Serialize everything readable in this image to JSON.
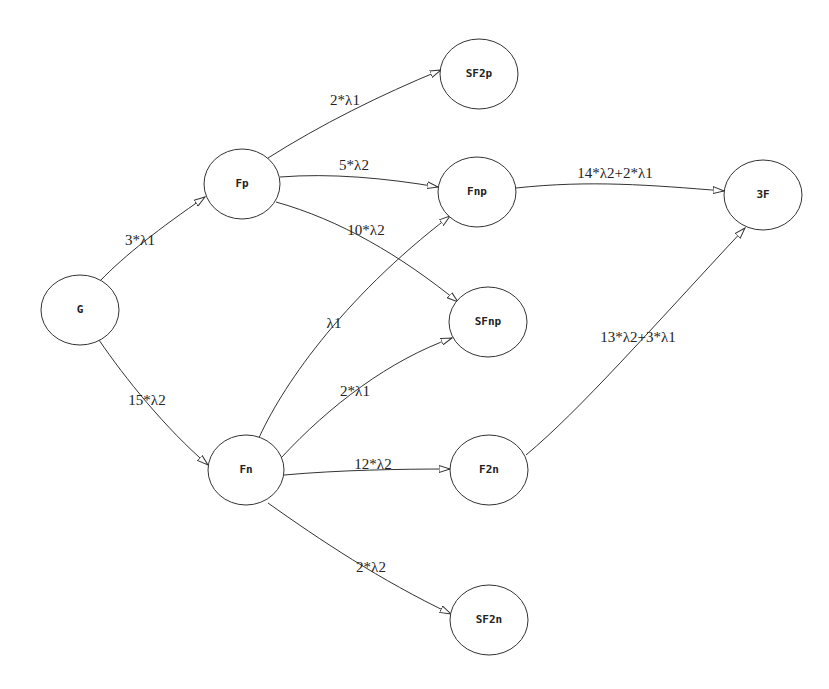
{
  "diagram": {
    "type": "state-transition-graph",
    "nodes": [
      {
        "id": "G",
        "label": "G",
        "cx": 80,
        "cy": 310,
        "rx": 39,
        "ry": 35
      },
      {
        "id": "Fp",
        "label": "Fp",
        "cx": 242,
        "cy": 184,
        "rx": 38,
        "ry": 35
      },
      {
        "id": "Fn",
        "label": "Fn",
        "cx": 246,
        "cy": 470,
        "rx": 38,
        "ry": 35
      },
      {
        "id": "SF2p",
        "label": "SF2p",
        "cx": 479,
        "cy": 74,
        "rx": 39,
        "ry": 35
      },
      {
        "id": "Fnp",
        "label": "Fnp",
        "cx": 477,
        "cy": 192,
        "rx": 39,
        "ry": 35
      },
      {
        "id": "SFnp",
        "label": "SFnp",
        "cx": 488,
        "cy": 322,
        "rx": 39,
        "ry": 35
      },
      {
        "id": "F2n",
        "label": "F2n",
        "cx": 489,
        "cy": 470,
        "rx": 39,
        "ry": 35
      },
      {
        "id": "SF2n",
        "label": "SF2n",
        "cx": 489,
        "cy": 620,
        "rx": 39,
        "ry": 35
      },
      {
        "id": "3F",
        "label": "3F",
        "cx": 763,
        "cy": 195,
        "rx": 39,
        "ry": 35
      }
    ],
    "edges": [
      {
        "from": "G",
        "to": "Fp",
        "label": "3*λ1",
        "path": "M100,281 C125,255 160,228 205,197",
        "lx": 140,
        "ly": 245
      },
      {
        "from": "G",
        "to": "Fn",
        "label": "15*λ2",
        "path": "M99,340 C125,378 165,428 208,465",
        "lx": 147,
        "ly": 405
      },
      {
        "from": "Fp",
        "to": "SF2p",
        "label": "2*λ1",
        "path": "M268,158 C320,125 380,95 441,70",
        "lx": 345,
        "ly": 105
      },
      {
        "from": "Fp",
        "to": "Fnp",
        "label": "5*λ2",
        "path": "M280,177 C330,173 385,178 438,187",
        "lx": 354,
        "ly": 170
      },
      {
        "from": "Fp",
        "to": "SFnp",
        "label": "10*λ2",
        "path": "M276,202 C340,220 400,255 458,302",
        "lx": 366,
        "ly": 235
      },
      {
        "from": "Fn",
        "to": "Fnp",
        "label": "λ1",
        "path": "M258,440 C280,390 340,300 450,216",
        "lx": 334,
        "ly": 328
      },
      {
        "from": "Fn",
        "to": "SFnp",
        "label": "2*λ1",
        "path": "M281,458 C330,405 390,360 452,338",
        "lx": 355,
        "ly": 396
      },
      {
        "from": "Fn",
        "to": "F2n",
        "label": "12*λ2",
        "path": "M284,475 C340,470 400,469 450,469",
        "lx": 373,
        "ly": 469
      },
      {
        "from": "Fn",
        "to": "SF2n",
        "label": "2*λ2",
        "path": "M268,503 C320,540 380,580 451,614",
        "lx": 371,
        "ly": 572
      },
      {
        "from": "Fnp",
        "to": "3F",
        "label": "14*λ2+2*λ1",
        "path": "M516,188 C590,180 650,185 724,191",
        "lx": 615,
        "ly": 178
      },
      {
        "from": "F2n",
        "to": "3F",
        "label": "13*λ2+3*λ1",
        "path": "M526,455 C580,410 650,330 745,228",
        "lx": 638,
        "ly": 342
      }
    ]
  }
}
